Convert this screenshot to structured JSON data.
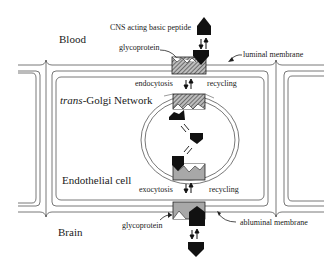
{
  "diagram": {
    "regions": {
      "blood": "Blood",
      "brain": "Brain",
      "endothelial_cell": "Endothelial cell",
      "golgi_prefix": "trans",
      "golgi_suffix": "-Golgi Network"
    },
    "labels": {
      "peptide": "CNS acting basic peptide",
      "glycoprotein_top": "glycoprotein",
      "glycoprotein_bottom": "glycoprotein",
      "luminal_membrane": "luminal membrane",
      "abluminal_membrane": "abluminal membrane",
      "endocytosis": "endocytosis",
      "exocytosis": "exocytosis",
      "recycling_top": "recycling",
      "recycling_bottom": "recycling"
    },
    "icons": {
      "peptide": "pentagon-peptide-icon",
      "receptor": "glycoprotein-receptor-icon",
      "arrows": "bidirectional-arrow-icon"
    },
    "colors": {
      "line": "#555555",
      "peptide_fill": "#111111",
      "hatched_receptor": "#8a8a8a",
      "gray_receptor": "#a8a8a8",
      "text": "#1a1a1a"
    }
  }
}
